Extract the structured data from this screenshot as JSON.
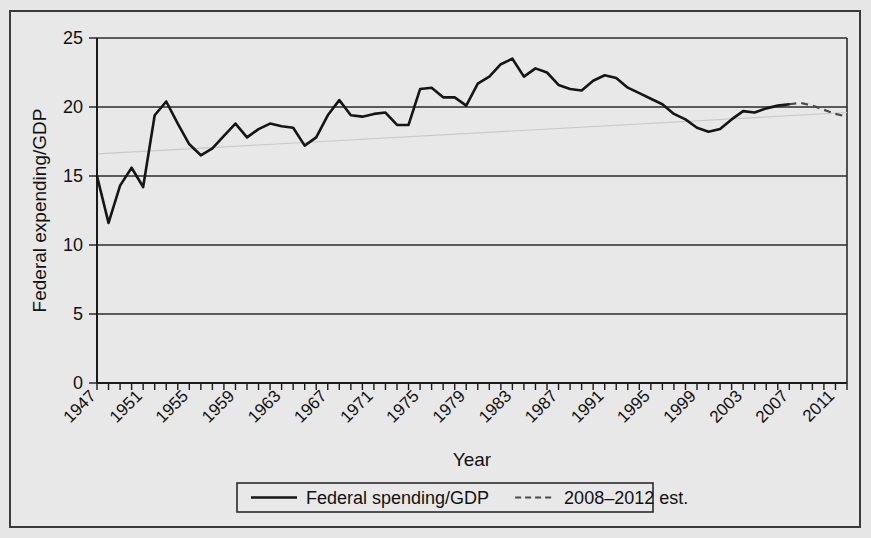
{
  "figure": {
    "background_color": "#e8e8e8",
    "frame_color": "#3a3a3a",
    "line_color": "#151515",
    "estimate_color": "#4a4a4a"
  },
  "axes": {
    "y_title": "Federal expending/GDP",
    "x_title": "Year",
    "y_ticks": [
      "0",
      "5",
      "10",
      "15",
      "20",
      "25"
    ],
    "x_tick_labels": [
      "1947",
      "1951",
      "1955",
      "1959",
      "1963",
      "1967",
      "1971",
      "1975",
      "1979",
      "1983",
      "1987",
      "1991",
      "1995",
      "1999",
      "2003",
      "2007",
      "2011"
    ]
  },
  "legend": {
    "items": [
      {
        "label": "Federal spending/GDP",
        "style": "solid"
      },
      {
        "label": "2008–2012 est.",
        "style": "dashed"
      }
    ]
  },
  "chart_data": {
    "type": "line",
    "title": "",
    "xlabel": "Year",
    "ylabel": "Federal expending/GDP",
    "xlim": [
      1947,
      2012
    ],
    "ylim": [
      0,
      25
    ],
    "y_ticks": [
      0,
      5,
      10,
      15,
      20,
      25
    ],
    "x_tick_step": 4,
    "x_minor_tick_step": 1,
    "grid": "horizontal",
    "legend_position": "below-axes",
    "series": [
      {
        "name": "Federal spending/GDP",
        "style": "solid",
        "x": [
          1947,
          1948,
          1949,
          1950,
          1951,
          1952,
          1953,
          1954,
          1955,
          1956,
          1957,
          1958,
          1959,
          1960,
          1961,
          1962,
          1963,
          1964,
          1965,
          1966,
          1967,
          1968,
          1969,
          1970,
          1971,
          1972,
          1973,
          1974,
          1975,
          1976,
          1977,
          1978,
          1979,
          1980,
          1981,
          1982,
          1983,
          1984,
          1985,
          1986,
          1987,
          1988,
          1989,
          1990,
          1991,
          1992,
          1993,
          1994,
          1995,
          1996,
          1997,
          1998,
          1999,
          2000,
          2001,
          2002,
          2003,
          2004,
          2005,
          2006,
          2007
        ],
        "values": [
          15.0,
          11.6,
          14.3,
          15.6,
          14.2,
          19.4,
          20.4,
          18.8,
          17.3,
          16.5,
          17.0,
          17.9,
          18.8,
          17.8,
          18.4,
          18.8,
          18.6,
          18.5,
          17.2,
          17.8,
          19.4,
          20.5,
          19.4,
          19.3,
          19.5,
          19.6,
          18.7,
          18.7,
          21.3,
          21.4,
          20.7,
          20.7,
          20.1,
          21.7,
          22.2,
          23.1,
          23.5,
          22.2,
          22.8,
          22.5,
          21.6,
          21.3,
          21.2,
          21.9,
          22.3,
          22.1,
          21.4,
          21.0,
          20.6,
          20.2,
          19.5,
          19.1,
          18.5,
          18.2,
          18.4,
          19.1,
          19.7,
          19.6,
          19.9,
          20.1,
          20.2
        ]
      },
      {
        "name": "2008–2012 est.",
        "style": "dashed",
        "x": [
          2007,
          2008,
          2009,
          2010,
          2011,
          2012
        ],
        "values": [
          20.2,
          20.3,
          20.1,
          19.8,
          19.5,
          19.3
        ]
      }
    ],
    "trend_overlay": {
      "name": "faint-background-trend",
      "x": [
        1947,
        2012
      ],
      "values": [
        16.6,
        19.6
      ],
      "color": "#c9c9c9"
    }
  }
}
